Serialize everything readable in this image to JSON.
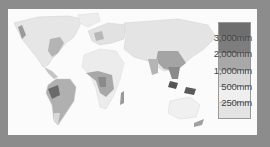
{
  "map": {
    "title": "World annual rainfall",
    "colors": {
      "frame": "#8c8c8c",
      "background": "#fbfbfb",
      "land_low": "#ececec",
      "land_250": "#e2e2e2",
      "land_500": "#d2d2d2",
      "land_1000": "#b0b0b0",
      "land_2000": "#8a8a8a",
      "land_3000": "#6a6a6a"
    }
  },
  "legend": {
    "items": [
      {
        "label": "3,000mm",
        "color": "#6e6e6e"
      },
      {
        "label": "2,000mm",
        "color": "#7d7d7d"
      },
      {
        "label": "1,000mm",
        "color": "#a8a8a8"
      },
      {
        "label": "500mm",
        "color": "#d9d9d9"
      },
      {
        "label": "250mm",
        "color": "#efefef"
      },
      {
        "label": "",
        "color": "#e3e3e3"
      }
    ]
  }
}
